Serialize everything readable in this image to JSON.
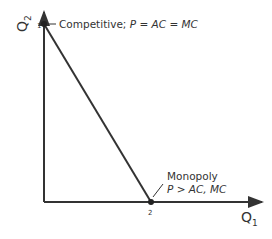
{
  "diagram": {
    "axes": {
      "x_label": "Q",
      "x_sub": "1",
      "y_label": "Q",
      "y_sub": "2"
    },
    "points": [
      {
        "id": "1",
        "label": "1",
        "annotation": "Competitive; ",
        "annotation_eq": "P = AC = MC"
      },
      {
        "id": "2",
        "label": "2",
        "annotation_title": "Monopoly",
        "annotation_eq": "P > AC, MC"
      }
    ],
    "line_color": "#333333"
  }
}
